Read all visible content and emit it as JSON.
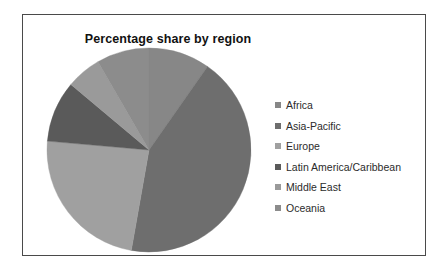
{
  "chart_data": {
    "type": "pie",
    "title": "Percentage share by region",
    "xlabel": "",
    "ylabel": "",
    "legend_position": "right",
    "grid": false,
    "start_angle_deg": 0,
    "direction": "clockwise",
    "categories": [
      "Africa",
      "Asia-Pacific",
      "Europe",
      "Latin America/Caribbean",
      "Middle East",
      "Oceania"
    ],
    "values": [
      9.7,
      43.1,
      23.6,
      9.7,
      5.6,
      8.3
    ],
    "angles_deg": [
      35,
      155,
      85,
      35,
      20,
      30
    ],
    "colors": [
      "#878787",
      "#6e6e6e",
      "#a0a0a0",
      "#5a5a5a",
      "#9a9a9a",
      "#8c8c8c"
    ],
    "series": [
      {
        "name": "Percentage share by region",
        "values": [
          9.7,
          43.1,
          23.6,
          9.7,
          5.6,
          8.3
        ]
      }
    ]
  },
  "figure": {
    "title": "Percentage share by region",
    "border_color": "#4a4a4a",
    "background": "#ffffff"
  },
  "legend": {
    "items": [
      {
        "label": "Africa",
        "color": "#878787"
      },
      {
        "label": "Asia-Pacific",
        "color": "#6e6e6e"
      },
      {
        "label": "Europe",
        "color": "#a0a0a0"
      },
      {
        "label": "Latin America/Caribbean",
        "color": "#5a5a5a"
      },
      {
        "label": "Middle East",
        "color": "#9a9a9a"
      },
      {
        "label": "Oceania",
        "color": "#8c8c8c"
      }
    ]
  }
}
